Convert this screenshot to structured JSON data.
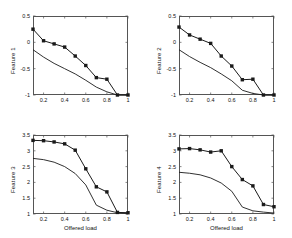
{
  "figure": {
    "background": "#ffffff",
    "line_color": "#1a1a1a",
    "axis_color": "#555555",
    "rows": 2,
    "cols": 2
  },
  "chart_data": [
    {
      "type": "line",
      "title": "",
      "xlabel": "",
      "ylabel": "Feature 1",
      "xlim": [
        0.1,
        1.0
      ],
      "ylim": [
        -1,
        0.5
      ],
      "xticks": [
        0.2,
        0.4,
        0.6,
        0.8,
        1
      ],
      "xticklabels": [
        "0.2",
        "0.4",
        "0.6",
        "0.8",
        "1"
      ],
      "yticks": [
        -1,
        -0.5,
        0,
        0.5
      ],
      "yticklabels": [
        "-1",
        "-0.5",
        "0",
        "0.5"
      ],
      "grid": false,
      "legend": "none",
      "x": [
        0.1,
        0.2,
        0.3,
        0.4,
        0.5,
        0.6,
        0.7,
        0.8,
        0.9,
        1.0
      ],
      "series": [
        {
          "name": "marker-series",
          "marker": "square",
          "values": [
            0.25,
            0.03,
            -0.03,
            -0.09,
            -0.26,
            -0.44,
            -0.67,
            -0.7,
            -1.0,
            -1.0
          ]
        },
        {
          "name": "plain-series",
          "marker": "none",
          "values": [
            -0.14,
            -0.28,
            -0.4,
            -0.5,
            -0.6,
            -0.72,
            -0.85,
            -0.94,
            -1.0,
            -1.0
          ]
        }
      ]
    },
    {
      "type": "line",
      "title": "",
      "xlabel": "",
      "ylabel": "Feature 2",
      "xlim": [
        0.1,
        1.0
      ],
      "ylim": [
        -1,
        0.5
      ],
      "xticks": [
        0.2,
        0.4,
        0.6,
        0.8,
        1
      ],
      "xticklabels": [
        "0.2",
        "0.4",
        "0.6",
        "0.8",
        "1"
      ],
      "yticks": [
        -1,
        -0.5,
        0,
        0.5
      ],
      "yticklabels": [
        "-1",
        "-0.5",
        "0",
        "0.5"
      ],
      "grid": false,
      "legend": "none",
      "x": [
        0.1,
        0.2,
        0.3,
        0.4,
        0.5,
        0.6,
        0.7,
        0.8,
        0.9,
        1.0
      ],
      "series": [
        {
          "name": "marker-series",
          "marker": "square",
          "values": [
            0.29,
            0.14,
            0.06,
            -0.02,
            -0.26,
            -0.45,
            -0.71,
            -0.7,
            -1.0,
            -1.0
          ]
        },
        {
          "name": "plain-series",
          "marker": "none",
          "values": [
            -0.14,
            -0.27,
            -0.38,
            -0.48,
            -0.6,
            -0.73,
            -0.91,
            -0.97,
            -1.0,
            -1.0
          ]
        }
      ]
    },
    {
      "type": "line",
      "title": "",
      "xlabel": "Offered load",
      "ylabel": "Feature 3",
      "xlim": [
        0.1,
        1.0
      ],
      "ylim": [
        1,
        3.5
      ],
      "xticks": [
        0.2,
        0.4,
        0.6,
        0.8,
        1
      ],
      "xticklabels": [
        "0.2",
        "0.4",
        "0.6",
        "0.8",
        "1"
      ],
      "yticks": [
        1,
        1.5,
        2,
        2.5,
        3,
        3.5
      ],
      "yticklabels": [
        "1",
        "1.5",
        "2",
        "2.5",
        "3",
        "3.5"
      ],
      "grid": false,
      "legend": "none",
      "x": [
        0.1,
        0.2,
        0.3,
        0.4,
        0.5,
        0.6,
        0.7,
        0.8,
        0.9,
        1.0
      ],
      "series": [
        {
          "name": "marker-series",
          "marker": "square",
          "values": [
            3.33,
            3.32,
            3.28,
            3.22,
            3.02,
            2.43,
            1.86,
            1.7,
            1.05,
            1.04
          ]
        },
        {
          "name": "plain-series",
          "marker": "none",
          "values": [
            2.76,
            2.72,
            2.64,
            2.5,
            2.28,
            1.92,
            1.28,
            1.12,
            1.04,
            1.02
          ]
        }
      ]
    },
    {
      "type": "line",
      "title": "",
      "xlabel": "Offered load",
      "ylabel": "Feature 4",
      "xlim": [
        0.1,
        1.0
      ],
      "ylim": [
        1,
        3.5
      ],
      "xticks": [
        0.2,
        0.4,
        0.6,
        0.8,
        1
      ],
      "xticklabels": [
        "0.2",
        "0.4",
        "0.6",
        "0.8",
        "1"
      ],
      "yticks": [
        1,
        1.5,
        2,
        2.5,
        3,
        3.5
      ],
      "yticklabels": [
        "1",
        "1.5",
        "2",
        "2.5",
        "3",
        "3.5"
      ],
      "grid": false,
      "legend": "none",
      "x": [
        0.1,
        0.2,
        0.3,
        0.4,
        0.5,
        0.6,
        0.7,
        0.8,
        0.9,
        1.0
      ],
      "series": [
        {
          "name": "marker-series",
          "marker": "square",
          "values": [
            3.06,
            3.07,
            3.03,
            2.96,
            3.0,
            2.5,
            2.09,
            1.89,
            1.3,
            1.23
          ]
        },
        {
          "name": "plain-series",
          "marker": "none",
          "values": [
            2.32,
            2.29,
            2.24,
            2.14,
            1.98,
            1.72,
            1.22,
            1.1,
            1.06,
            1.03
          ]
        }
      ]
    }
  ]
}
